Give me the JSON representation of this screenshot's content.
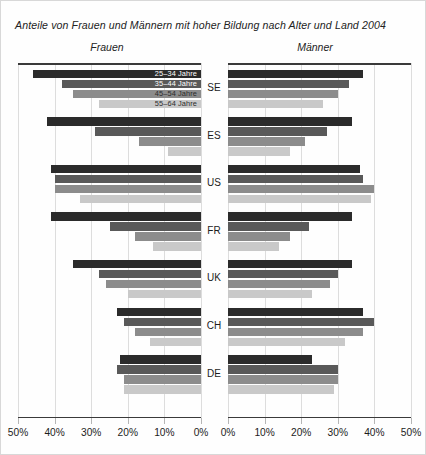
{
  "title": "Anteile von Frauen und Männern mit hoher Bildung nach Alter und Land 2004",
  "panels": {
    "left_caption": "Frauen",
    "right_caption": "Männer"
  },
  "legend": {
    "items": [
      {
        "label": "25–34 Jahre",
        "color": "#2b2b2b"
      },
      {
        "label": "35–44 Jahre",
        "color": "#595959"
      },
      {
        "label": "45–54 Jahre",
        "color": "#8c8c8c"
      },
      {
        "label": "55–64 Jahre",
        "color": "#c9c9c9"
      }
    ]
  },
  "axis": {
    "left_ticks": [
      "50%",
      "40%",
      "30%",
      "20%",
      "10%",
      "0%"
    ],
    "right_ticks": [
      "0%",
      "10%",
      "20%",
      "30%",
      "40%",
      "50%"
    ],
    "max": 50,
    "unit": "%"
  },
  "chart_data": {
    "type": "bar",
    "orientation": "horizontal-diverging",
    "title": "Anteile von Frauen und Männern mit hoher Bildung nach Alter und Land 2004",
    "xlabel": "",
    "ylabel": "",
    "xlim": [
      0,
      50
    ],
    "grid": true,
    "legend_position": "inside-top-left",
    "categories": [
      "SE",
      "ES",
      "US",
      "FR",
      "UK",
      "CH",
      "DE"
    ],
    "age_groups": [
      "25–34 Jahre",
      "35–44 Jahre",
      "45–54 Jahre",
      "55–64 Jahre"
    ],
    "panels": [
      "Frauen",
      "Männer"
    ],
    "series": [
      {
        "name": "Frauen – 25–34 Jahre",
        "panel": "Frauen",
        "values": [
          46,
          42,
          41,
          41,
          35,
          23,
          22
        ]
      },
      {
        "name": "Frauen – 35–44 Jahre",
        "panel": "Frauen",
        "values": [
          38,
          29,
          40,
          25,
          28,
          21,
          23
        ]
      },
      {
        "name": "Frauen – 45–54 Jahre",
        "panel": "Frauen",
        "values": [
          35,
          17,
          40,
          18,
          26,
          18,
          21
        ]
      },
      {
        "name": "Frauen – 55–64 Jahre",
        "panel": "Frauen",
        "values": [
          28,
          9,
          33,
          13,
          20,
          14,
          21
        ]
      },
      {
        "name": "Männer – 25–34 Jahre",
        "panel": "Männer",
        "values": [
          37,
          34,
          36,
          34,
          34,
          37,
          23
        ]
      },
      {
        "name": "Männer – 35–44 Jahre",
        "panel": "Männer",
        "values": [
          33,
          27,
          37,
          22,
          30,
          40,
          30
        ]
      },
      {
        "name": "Männer – 45–54 Jahre",
        "panel": "Männer",
        "values": [
          30,
          21,
          40,
          17,
          28,
          37,
          30
        ]
      },
      {
        "name": "Männer – 55–64 Jahre",
        "panel": "Männer",
        "values": [
          26,
          17,
          39,
          14,
          23,
          32,
          29
        ]
      }
    ],
    "groups": [
      {
        "country": "SE",
        "frauen": [
          46,
          38,
          35,
          28
        ],
        "maenner": [
          37,
          33,
          30,
          26
        ]
      },
      {
        "country": "ES",
        "frauen": [
          42,
          29,
          17,
          9
        ],
        "maenner": [
          34,
          27,
          21,
          17
        ]
      },
      {
        "country": "US",
        "frauen": [
          41,
          40,
          40,
          33
        ],
        "maenner": [
          36,
          37,
          40,
          39
        ]
      },
      {
        "country": "FR",
        "frauen": [
          41,
          25,
          18,
          13
        ],
        "maenner": [
          34,
          22,
          17,
          14
        ]
      },
      {
        "country": "UK",
        "frauen": [
          35,
          28,
          26,
          20
        ],
        "maenner": [
          34,
          30,
          28,
          23
        ]
      },
      {
        "country": "CH",
        "frauen": [
          23,
          21,
          18,
          14
        ],
        "maenner": [
          37,
          40,
          37,
          32
        ]
      },
      {
        "country": "DE",
        "frauen": [
          22,
          23,
          21,
          21
        ],
        "maenner": [
          23,
          30,
          30,
          29
        ]
      }
    ]
  }
}
